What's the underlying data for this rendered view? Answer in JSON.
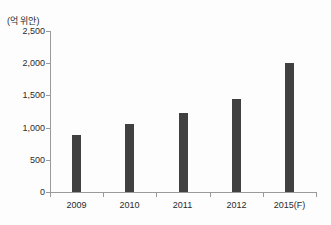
{
  "chart_data": {
    "type": "bar",
    "title": "",
    "xlabel": "",
    "ylabel": "(억 위안)",
    "categories": [
      "2009",
      "2010",
      "2011",
      "2012",
      "2015(F)"
    ],
    "values": [
      880,
      1050,
      1230,
      1450,
      2000
    ],
    "y_tick_labels": [
      "0",
      "500",
      "1,000",
      "1,500",
      "2,000",
      "2,500"
    ],
    "y_tick_values": [
      0,
      500,
      1000,
      1500,
      2000,
      2500
    ],
    "ylim": [
      0,
      2500
    ],
    "grid": false,
    "legend": "none",
    "bar_color": "#404040",
    "axis_color": "#9a9a9a",
    "text_color": "#2b2b2b"
  }
}
